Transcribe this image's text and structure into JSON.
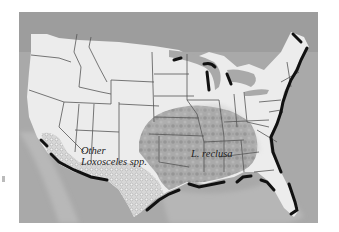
{
  "map": {
    "title": "",
    "region": "Contiguous United States",
    "labels": {
      "other_line1": "Other",
      "other_line2": "Loxosceles spp.",
      "reclusa": "L. reclusa"
    },
    "legend_regions": [
      {
        "name": "L. reclusa",
        "pattern": "dark mottled",
        "area": "south-central and midwestern US"
      },
      {
        "name": "Other Loxosceles spp.",
        "pattern": "light dotted",
        "area": "southwest US and Texas border"
      }
    ],
    "colors": {
      "land": "#ececec",
      "ocean": "#a9a9a9",
      "shelf": "#bdbdbd",
      "borders": "#555555",
      "coast_shadow": "#111111",
      "reclusa_range": "#9c9c9c",
      "other_range": "#c8c8c8"
    }
  }
}
